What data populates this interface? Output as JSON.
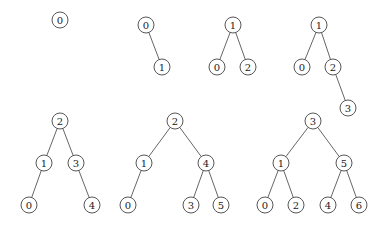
{
  "diagram": {
    "title": "",
    "colors": {
      "edge": "#555555",
      "node_stroke": "#444444",
      "node_fill": "#ffffff",
      "text": "#222222"
    },
    "trees": [
      {
        "id": "tree-1",
        "nodes": [
          {
            "key": "0"
          }
        ],
        "edges": []
      },
      {
        "id": "tree-2",
        "nodes": [
          {
            "key": "0"
          },
          {
            "key": "1"
          }
        ],
        "edges": [
          [
            "0",
            "1"
          ]
        ]
      },
      {
        "id": "tree-3",
        "nodes": [
          {
            "key": "1"
          },
          {
            "key": "0"
          },
          {
            "key": "2"
          }
        ],
        "edges": [
          [
            "1",
            "0"
          ],
          [
            "1",
            "2"
          ]
        ]
      },
      {
        "id": "tree-4",
        "nodes": [
          {
            "key": "1"
          },
          {
            "key": "0"
          },
          {
            "key": "2"
          },
          {
            "key": "3"
          }
        ],
        "edges": [
          [
            "1",
            "0"
          ],
          [
            "1",
            "2"
          ],
          [
            "2",
            "3"
          ]
        ]
      },
      {
        "id": "tree-5",
        "nodes": [
          {
            "key": "2"
          },
          {
            "key": "1"
          },
          {
            "key": "3"
          },
          {
            "key": "0"
          },
          {
            "key": "4"
          }
        ],
        "edges": [
          [
            "2",
            "1"
          ],
          [
            "2",
            "3"
          ],
          [
            "1",
            "0"
          ],
          [
            "3",
            "4"
          ]
        ]
      },
      {
        "id": "tree-6",
        "nodes": [
          {
            "key": "2"
          },
          {
            "key": "1"
          },
          {
            "key": "4"
          },
          {
            "key": "0"
          },
          {
            "key": "3"
          },
          {
            "key": "5"
          }
        ],
        "edges": [
          [
            "2",
            "1"
          ],
          [
            "2",
            "4"
          ],
          [
            "1",
            "0"
          ],
          [
            "4",
            "3"
          ],
          [
            "4",
            "5"
          ]
        ]
      },
      {
        "id": "tree-7",
        "nodes": [
          {
            "key": "3"
          },
          {
            "key": "1"
          },
          {
            "key": "5"
          },
          {
            "key": "0"
          },
          {
            "key": "2"
          },
          {
            "key": "4"
          },
          {
            "key": "6"
          }
        ],
        "edges": [
          [
            "3",
            "1"
          ],
          [
            "3",
            "5"
          ],
          [
            "1",
            "0"
          ],
          [
            "1",
            "2"
          ],
          [
            "5",
            "4"
          ],
          [
            "5",
            "6"
          ]
        ]
      }
    ]
  }
}
